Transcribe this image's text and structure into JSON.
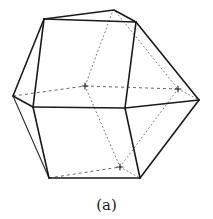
{
  "figure": {
    "caption": "(a)",
    "colors": {
      "edge": "#1a1a1a",
      "hidden_edge": "#666666",
      "background": "#ffffff"
    },
    "vertices": {
      "apex": [
        114,
        10
      ],
      "top_left": [
        44,
        19
      ],
      "top_right": [
        136,
        22
      ],
      "left": [
        13,
        96
      ],
      "mid_left": [
        33,
        107
      ],
      "mid_right": [
        125,
        108
      ],
      "right": [
        199,
        100
      ],
      "bottom_left": [
        49,
        178
      ],
      "bottom_right": [
        140,
        178
      ],
      "back_center": [
        85,
        86
      ],
      "back_right": [
        178,
        89
      ],
      "back_bottom": [
        120,
        167
      ]
    }
  }
}
